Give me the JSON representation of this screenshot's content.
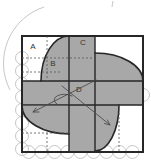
{
  "figure": {
    "kind": "geometry-diagram",
    "region_labels": [
      {
        "text": "A",
        "shaded": false
      },
      {
        "text": "B",
        "shaded": true
      },
      {
        "text": "C",
        "shaded": true
      },
      {
        "text": "D",
        "shaded": true
      }
    ],
    "colors": {
      "shaded": "#a8a8a8",
      "outline": "#262626",
      "construction": "#bfbfbf",
      "dashed_line": "#555555",
      "annotation": "#4d4d4d",
      "background": "#ffffff"
    }
  }
}
